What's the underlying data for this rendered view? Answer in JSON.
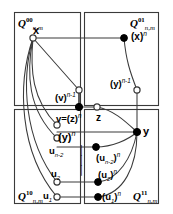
{
  "figure": {
    "type": "graph-diagram",
    "background": "#ffffff",
    "line_color": "#3a3a3a",
    "node_fill_open": "#ffffff",
    "node_fill_closed": "#000000"
  },
  "quadrant_labels": {
    "top_left": {
      "base": "Q",
      "sup": "00",
      "sub": "n,m"
    },
    "top_right": {
      "base": "Q",
      "sup": "01",
      "sub": "n,m"
    },
    "bottom_left": {
      "base": "Q",
      "sup": "10",
      "sub": "n,m"
    },
    "bottom_right": {
      "base": "Q",
      "sup": "11",
      "sub": "n,m"
    }
  },
  "nodes": {
    "x": {
      "label": "x",
      "sup": "",
      "style": "open"
    },
    "x_n": {
      "label": "(x)",
      "sup": "n",
      "style": "filled"
    },
    "v_nm1": {
      "label": "(v)",
      "sup": "n-1",
      "style": "open"
    },
    "y_nm1": {
      "label": "(y)",
      "sup": "n-1",
      "style": "open"
    },
    "v_eq_z_n": {
      "label": "v=(z)",
      "sup": "n",
      "style": "filled"
    },
    "z": {
      "label": "z",
      "sup": "",
      "style": "open"
    },
    "y": {
      "label": "y",
      "sup": "",
      "style": "filled"
    },
    "y_n": {
      "label": "(y)",
      "sup": "n",
      "style": "open"
    },
    "u_nm2": {
      "label": "u",
      "sub": "n-2",
      "style": "open"
    },
    "u_nm2_n": {
      "label": "(u",
      "sub": "n-2",
      "tail": ")",
      "sup": "n",
      "style": "filled"
    },
    "u_2": {
      "label": "u",
      "sub": "2",
      "style": "open"
    },
    "u_2_n": {
      "label": "(u",
      "sub": "2",
      "tail": ")",
      "sup": "n",
      "style": "filled"
    },
    "u_1": {
      "label": "u",
      "sub": "1",
      "style": "open"
    },
    "u_1_n": {
      "label": "(u",
      "sub": "1",
      "tail": ")",
      "sup": "n",
      "style": "filled"
    }
  },
  "ellipsis": {
    "glyph": "│",
    "count": 3,
    "meaning": "vertical-dots"
  }
}
